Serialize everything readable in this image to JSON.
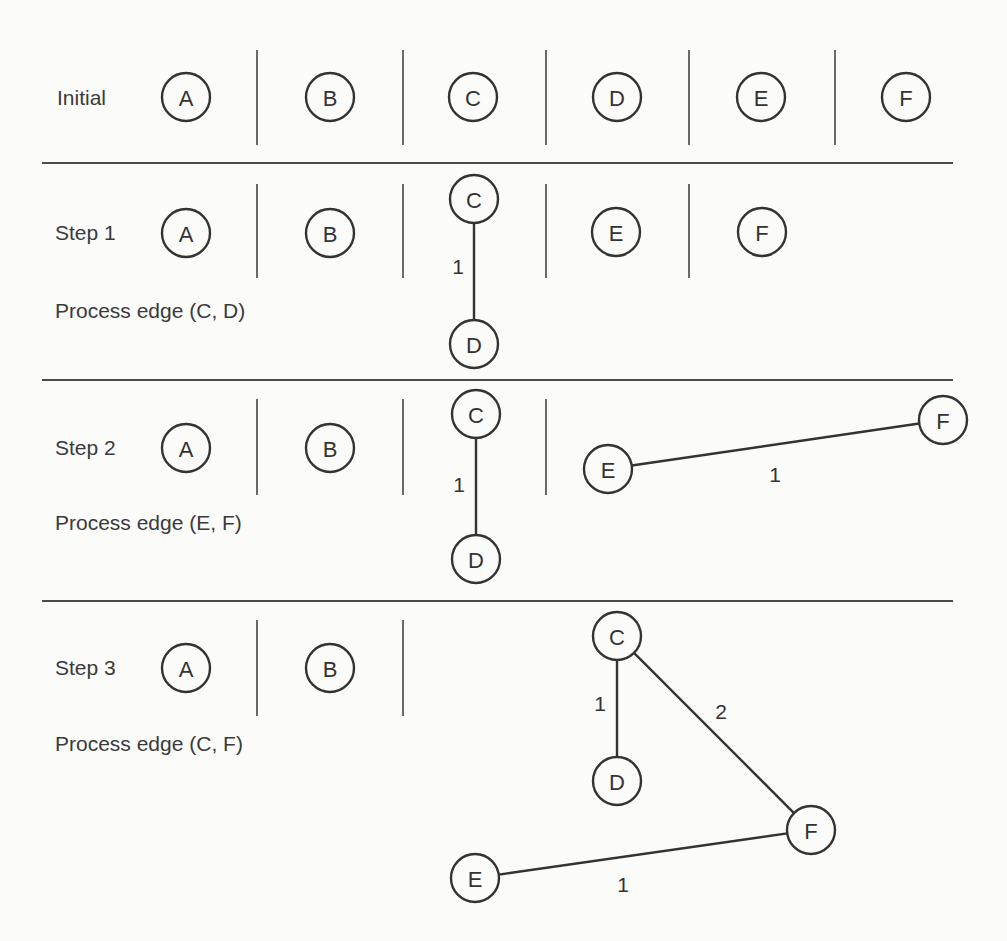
{
  "colors": {
    "background": "#fbfbfa",
    "ink": "#333333",
    "separator": "#4a4a4a"
  },
  "node_radius": 24,
  "separators": [
    {
      "x1": 42,
      "x2": 953,
      "y": 163
    },
    {
      "x1": 42,
      "x2": 953,
      "y": 380
    },
    {
      "x1": 42,
      "x2": 953,
      "y": 601
    }
  ],
  "rows": [
    {
      "id": "initial",
      "label": "Initial",
      "label_pos": {
        "x": 57,
        "y": 105
      },
      "caption": "",
      "caption_pos": {
        "x": 55,
        "y": 318
      },
      "dividers": [
        {
          "x": 257,
          "y1": 50,
          "y2": 145
        },
        {
          "x": 403,
          "y1": 50,
          "y2": 145
        },
        {
          "x": 546,
          "y1": 50,
          "y2": 145
        },
        {
          "x": 689,
          "y1": 50,
          "y2": 145
        },
        {
          "x": 835,
          "y1": 50,
          "y2": 145
        }
      ],
      "nodes": [
        {
          "id": "A",
          "label": "A",
          "x": 186,
          "y": 97
        },
        {
          "id": "B",
          "label": "B",
          "x": 330,
          "y": 97
        },
        {
          "id": "C",
          "label": "C",
          "x": 473,
          "y": 97
        },
        {
          "id": "D",
          "label": "D",
          "x": 617,
          "y": 97
        },
        {
          "id": "E",
          "label": "E",
          "x": 761,
          "y": 97
        },
        {
          "id": "F",
          "label": "F",
          "x": 906,
          "y": 97
        }
      ],
      "edges": []
    },
    {
      "id": "step-1",
      "label": "Step 1",
      "label_pos": {
        "x": 55,
        "y": 240
      },
      "caption": "Process edge (C, D)",
      "caption_pos": {
        "x": 55,
        "y": 318
      },
      "dividers": [
        {
          "x": 257,
          "y1": 184,
          "y2": 278
        },
        {
          "x": 403,
          "y1": 184,
          "y2": 278
        },
        {
          "x": 546,
          "y1": 184,
          "y2": 278
        },
        {
          "x": 689,
          "y1": 184,
          "y2": 278
        }
      ],
      "nodes": [
        {
          "id": "A",
          "label": "A",
          "x": 186,
          "y": 233
        },
        {
          "id": "B",
          "label": "B",
          "x": 330,
          "y": 233
        },
        {
          "id": "C",
          "label": "C",
          "x": 474,
          "y": 199
        },
        {
          "id": "D",
          "label": "D",
          "x": 474,
          "y": 344
        },
        {
          "id": "E",
          "label": "E",
          "x": 616,
          "y": 232
        },
        {
          "id": "F",
          "label": "F",
          "x": 762,
          "y": 232
        }
      ],
      "edges": [
        {
          "from": "C",
          "to": "D",
          "weight": "1",
          "label_x": 458,
          "label_y": 266
        }
      ]
    },
    {
      "id": "step-2",
      "label": "Step 2",
      "label_pos": {
        "x": 55,
        "y": 455
      },
      "caption": "Process edge (E, F)",
      "caption_pos": {
        "x": 55,
        "y": 530
      },
      "dividers": [
        {
          "x": 257,
          "y1": 399,
          "y2": 495
        },
        {
          "x": 403,
          "y1": 399,
          "y2": 495
        },
        {
          "x": 546,
          "y1": 399,
          "y2": 495
        }
      ],
      "nodes": [
        {
          "id": "A",
          "label": "A",
          "x": 186,
          "y": 448
        },
        {
          "id": "B",
          "label": "B",
          "x": 330,
          "y": 448
        },
        {
          "id": "C",
          "label": "C",
          "x": 476,
          "y": 414
        },
        {
          "id": "D",
          "label": "D",
          "x": 476,
          "y": 559
        },
        {
          "id": "E",
          "label": "E",
          "x": 608,
          "y": 469
        },
        {
          "id": "F",
          "label": "F",
          "x": 943,
          "y": 420
        }
      ],
      "edges": [
        {
          "from": "C",
          "to": "D",
          "weight": "1",
          "label_x": 459,
          "label_y": 484
        },
        {
          "from": "E",
          "to": "F",
          "weight": "1",
          "label_x": 775,
          "label_y": 474
        }
      ]
    },
    {
      "id": "step-3",
      "label": "Step 3",
      "label_pos": {
        "x": 55,
        "y": 675
      },
      "caption": "Process edge (C, F)",
      "caption_pos": {
        "x": 55,
        "y": 751
      },
      "dividers": [
        {
          "x": 257,
          "y1": 620,
          "y2": 716
        },
        {
          "x": 403,
          "y1": 620,
          "y2": 716
        }
      ],
      "nodes": [
        {
          "id": "A",
          "label": "A",
          "x": 186,
          "y": 668
        },
        {
          "id": "B",
          "label": "B",
          "x": 330,
          "y": 668
        },
        {
          "id": "C",
          "label": "C",
          "x": 617,
          "y": 636
        },
        {
          "id": "D",
          "label": "D",
          "x": 617,
          "y": 781
        },
        {
          "id": "F",
          "label": "F",
          "x": 811,
          "y": 830
        },
        {
          "id": "E",
          "label": "E",
          "x": 475,
          "y": 878
        }
      ],
      "edges": [
        {
          "from": "C",
          "to": "D",
          "weight": "1",
          "label_x": 600,
          "label_y": 703
        },
        {
          "from": "C",
          "to": "F",
          "weight": "2",
          "label_x": 721,
          "label_y": 711
        },
        {
          "from": "E",
          "to": "F",
          "weight": "1",
          "label_x": 623,
          "label_y": 884
        }
      ]
    }
  ]
}
